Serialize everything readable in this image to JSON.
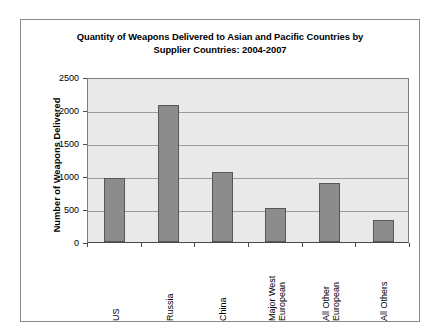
{
  "chart_data": {
    "type": "bar",
    "title": "Quantity of Weapons Delivered to Asian and Pacific Countries by Supplier Countries: 2004-2007",
    "title_lines": [
      "Quantity of Weapons Delivered to Asian and Pacific Countries by",
      "Supplier Countries: 2004-2007"
    ],
    "xlabel": "",
    "ylabel": "Number of Weapons Delivered",
    "categories": [
      "US",
      "Russia",
      "China",
      "Major West European",
      "All Other European",
      "All Others"
    ],
    "category_label_lines": [
      [
        "US"
      ],
      [
        "Russia"
      ],
      [
        "China"
      ],
      [
        "Major West",
        "European"
      ],
      [
        "All Other",
        "European"
      ],
      [
        "All Others"
      ]
    ],
    "values": [
      970,
      2070,
      1060,
      510,
      890,
      340
    ],
    "ylim": [
      0,
      2500
    ],
    "yticks": [
      0,
      500,
      1000,
      1500,
      2000,
      2500
    ],
    "ytick_labels": [
      "0",
      "500",
      "1000",
      "1500",
      "2000",
      "2500"
    ],
    "grid": true,
    "legend": false,
    "bar_color": "#8c8c8c",
    "bar_border_color": "#575757",
    "plot_background": "#e9e9e9",
    "page_background": "#ffffff",
    "frame_border_color": "#8a8a8a",
    "gridline_color": "#9b9b9b"
  }
}
